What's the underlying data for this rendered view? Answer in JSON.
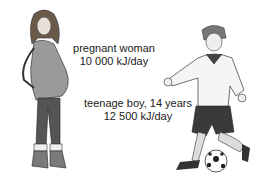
{
  "labels": {
    "woman": {
      "line1": "pregnant woman",
      "line2": "10 000 kJ/day"
    },
    "boy": {
      "line1": "teenage boy, 14 years",
      "line2": "12 500 kJ/day"
    }
  },
  "figures": {
    "woman": "pregnant-woman-illustration",
    "boy": "teenage-boy-kicking-ball-illustration"
  }
}
